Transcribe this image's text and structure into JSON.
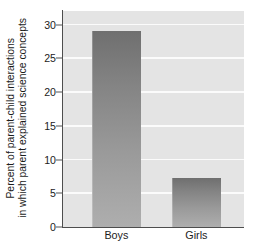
{
  "chart_data": {
    "type": "bar",
    "title": "",
    "subtitle": "",
    "categories": [
      "Boys",
      "Girls"
    ],
    "values": [
      29,
      7.2
    ],
    "series": [
      {
        "name": "Percent of parent-child interactions in which parent explained science concepts",
        "values": [
          29,
          7.2
        ]
      }
    ],
    "xlabel": "",
    "ylabel_lines": [
      "Percent of parent-child interactions",
      "in which parent explained science concepts"
    ],
    "ylabel": "Percent of parent-child interactions in which parent explained science concepts",
    "ylim": [
      0,
      32
    ],
    "yticks": [
      0,
      5,
      10,
      15,
      20,
      25,
      30
    ],
    "ytick_labels": [
      "0",
      "5",
      "10",
      "15",
      "20",
      "25",
      "30"
    ],
    "grid": true,
    "grid_axis": "y",
    "grid_color": "#fbfbfb",
    "legend": false,
    "legend_position": "none",
    "plot_background": "#e4e4e4",
    "figure_background": "#ffffff",
    "bar_color_top": "#6f6f6f",
    "bar_color_bottom": "#aeaeae",
    "axis_color": "#4d4d4d",
    "text_color": "#1c1c1c",
    "bar_geometry": [
      {
        "category": "Boys",
        "center_pct": 16.0,
        "width_pct": 27.0
      },
      {
        "category": "Girls",
        "center_pct": 60.2,
        "width_pct": 27.0
      }
    ]
  }
}
